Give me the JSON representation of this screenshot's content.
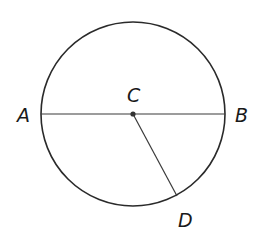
{
  "diagram": {
    "type": "circle-geometry",
    "circle": {
      "cx": 133,
      "cy": 114,
      "r": 92,
      "stroke": "#2a2a2a"
    },
    "center_point": {
      "label": "C",
      "x": 133,
      "y": 114
    },
    "points": [
      {
        "label": "A",
        "x": 41,
        "y": 114
      },
      {
        "label": "B",
        "x": 225,
        "y": 114
      },
      {
        "label": "D",
        "x": 177,
        "y": 196
      }
    ],
    "segments": [
      {
        "from": "A",
        "to": "B",
        "name": "diameter AB"
      },
      {
        "from": "C",
        "to": "D",
        "name": "radius CD"
      }
    ],
    "labels": {
      "A": "A",
      "B": "B",
      "C": "C",
      "D": "D"
    }
  }
}
